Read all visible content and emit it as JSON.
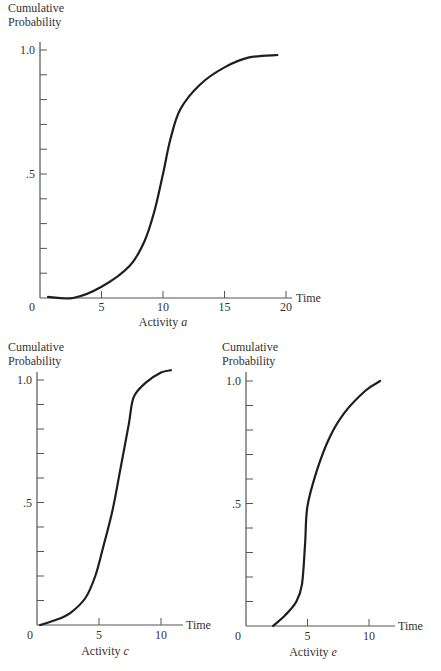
{
  "chart_data": [
    {
      "type": "line",
      "title": "",
      "caption": "Activity a",
      "caption_prefix": "Activity",
      "caption_var": "a",
      "ylabel_line1": "Cumulative",
      "ylabel_line2": "Probability",
      "xlabel": "Time",
      "xlim": [
        0,
        20
      ],
      "ylim": [
        0,
        1.0
      ],
      "x_ticks": [
        0,
        5,
        10,
        15,
        20
      ],
      "x_tick_labels": [
        "0",
        "5",
        "10",
        "15",
        "20"
      ],
      "y_tick_labels": [
        ".5",
        "1.0"
      ],
      "y_minor_ticks_step": 0.1,
      "grid": false,
      "series": [
        {
          "name": "Activity a",
          "x": [
            0.65,
            2.7,
            5.0,
            7.3,
            8.5,
            9.3,
            10.0,
            10.6,
            11.4,
            13.0,
            15.0,
            17.0,
            19.3
          ],
          "y": [
            0.005,
            0.0,
            0.045,
            0.13,
            0.23,
            0.35,
            0.5,
            0.64,
            0.76,
            0.86,
            0.93,
            0.97,
            0.98
          ]
        }
      ]
    },
    {
      "type": "line",
      "title": "",
      "caption": "Activity c",
      "caption_prefix": "Activity",
      "caption_var": "c",
      "ylabel_line1": "Cumulative",
      "ylabel_line2": "Probability",
      "xlabel": "Time",
      "xlim": [
        0,
        12
      ],
      "ylim": [
        0,
        1.0
      ],
      "x_ticks": [
        0,
        5,
        10
      ],
      "x_tick_labels": [
        "0",
        "5",
        "10"
      ],
      "y_tick_labels": [
        ".5",
        "1.0"
      ],
      "y_minor_ticks_step": 0.1,
      "grid": false,
      "series": [
        {
          "name": "Activity c",
          "x": [
            0.25,
            1.5,
            2.7,
            3.9,
            4.7,
            5.3,
            6.1,
            6.7,
            7.4,
            7.8,
            8.8,
            10.0,
            10.8
          ],
          "y": [
            0.0,
            0.02,
            0.05,
            0.11,
            0.2,
            0.31,
            0.47,
            0.63,
            0.82,
            0.93,
            0.99,
            1.03,
            1.04
          ]
        }
      ]
    },
    {
      "type": "line",
      "title": "",
      "caption": "Activity e",
      "caption_prefix": "Activity",
      "caption_var": "e",
      "ylabel_line1": "Cumulative",
      "ylabel_line2": "Probability",
      "xlabel": "Time",
      "xlim": [
        0,
        12
      ],
      "ylim": [
        0,
        1.0
      ],
      "x_ticks": [
        0,
        5,
        10
      ],
      "x_tick_labels": [
        "0",
        "5",
        "10"
      ],
      "y_tick_labels": [
        ".5",
        "1.0"
      ],
      "y_minor_ticks_step": 0.1,
      "grid": false,
      "series": [
        {
          "name": "Activity e",
          "x": [
            2.2,
            3.2,
            4.1,
            4.55,
            4.8,
            5.0,
            5.8,
            6.8,
            8.0,
            9.7,
            10.9
          ],
          "y": [
            0.0,
            0.045,
            0.1,
            0.17,
            0.33,
            0.49,
            0.64,
            0.77,
            0.87,
            0.96,
            1.0
          ]
        }
      ]
    }
  ]
}
